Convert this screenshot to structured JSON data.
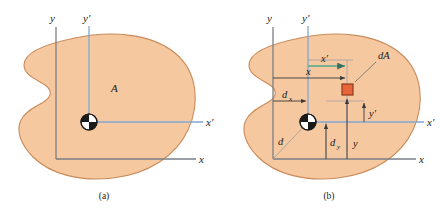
{
  "figure": {
    "type": "engineering-diagram",
    "panels": [
      {
        "id": "a",
        "caption": "(a)",
        "labels": {
          "area": "A",
          "axis_y": "y",
          "axis_y_prime": "y′",
          "axis_x": "x",
          "axis_x_prime": "x′"
        }
      },
      {
        "id": "b",
        "caption": "(b)",
        "labels": {
          "axis_y": "y",
          "axis_y_prime": "y′",
          "axis_x": "x",
          "axis_x_prime": "x′",
          "element": "dA",
          "dist_x": "x",
          "dist_x_prime": "x′",
          "dist_y": "y",
          "dist_y_prime": "y′",
          "offset_d": "d",
          "offset_dx_base": "d",
          "offset_dx_sub": "x",
          "offset_dy_base": "d",
          "offset_dy_sub": "y"
        }
      }
    ],
    "colors": {
      "area_fill": "#F5C8A0",
      "area_stroke": "#C98B5A",
      "primary_axis": "#7A7E86",
      "centroidal_axis": "#7FA8D4",
      "element_fill": "#E8653A",
      "element_stroke": "#8C3A1E",
      "dimension_line": "#3A3A3A",
      "dim_accent": "#4FA88B",
      "text": "#1A1A1A"
    },
    "centroid_symbol": "centroid-quadrant-circle"
  }
}
